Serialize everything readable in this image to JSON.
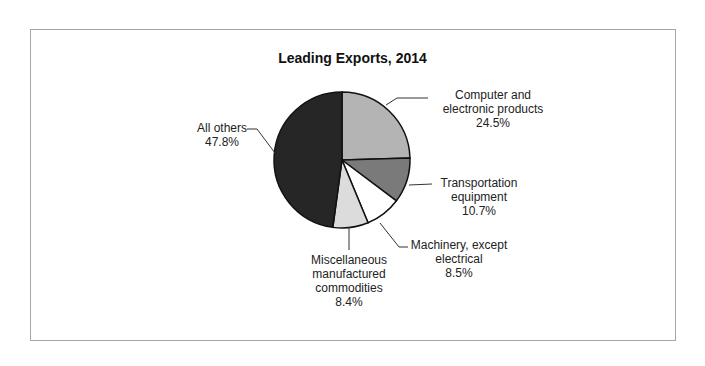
{
  "chart_data": {
    "type": "pie",
    "title": "Leading Exports, 2014",
    "slices": [
      {
        "label": "Computer and electronic products",
        "value": 24.5,
        "display": "24.5%",
        "color": "#b4b4b4"
      },
      {
        "label": "Transportation equipment",
        "value": 10.7,
        "display": "10.7%",
        "color": "#7a7a7a"
      },
      {
        "label": "Machinery, except electrical",
        "value": 8.5,
        "display": "8.5%",
        "color": "#ffffff"
      },
      {
        "label": "Miscellaneous manufactured commodities",
        "value": 8.4,
        "display": "8.4%",
        "color": "#dcdcdc"
      },
      {
        "label": "All others",
        "value": 47.8,
        "display": "47.8%",
        "color": "#262626"
      }
    ],
    "start_angle": "12 o'clock",
    "direction": "clockwise",
    "legend": "none (callout labels)"
  },
  "labels": {
    "computer": {
      "line1": "Computer and",
      "line2": "electronic products",
      "pct": "24.5%"
    },
    "transport": {
      "line1": "Transportation",
      "line2": "equipment",
      "pct": "10.7%"
    },
    "machinery": {
      "line1": "Machinery, except",
      "line2": "electrical",
      "pct": "8.5%"
    },
    "misc": {
      "line1": "Miscellaneous",
      "line2": "manufactured",
      "line3": "commodities",
      "pct": "8.4%"
    },
    "others": {
      "line1": "All others",
      "pct": "47.8%"
    }
  }
}
